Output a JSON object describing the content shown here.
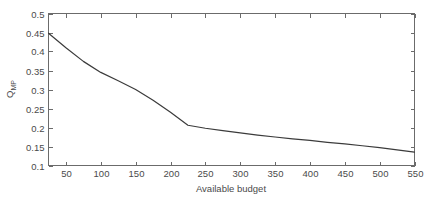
{
  "chart_data": {
    "type": "line",
    "title": "",
    "xlabel": "Available budget",
    "ylabel": "Q_MP",
    "ylabel_base": "Q",
    "ylabel_subscript": "MP",
    "xlim": [
      25,
      550
    ],
    "ylim": [
      0.1,
      0.5
    ],
    "xticks": [
      50,
      100,
      150,
      200,
      250,
      300,
      350,
      400,
      450,
      500,
      550
    ],
    "xticklabels": [
      "50",
      "100",
      "150",
      "200",
      "250",
      "300",
      "350",
      "400",
      "450",
      "500",
      "550"
    ],
    "yticks": [
      0.1,
      0.15,
      0.2,
      0.25,
      0.3,
      0.35,
      0.4,
      0.45,
      0.5
    ],
    "yticklabels": [
      "0.1",
      "0.15",
      "0.2",
      "0.25",
      "0.3",
      "0.35",
      "0.4",
      "0.45",
      "0.5"
    ],
    "grid": false,
    "legend": null,
    "box": true,
    "tick_direction": "in",
    "line_color": "#3b3b3b",
    "axis_color": "#6b6b6b",
    "background_color": "#ffffff",
    "series": [
      {
        "name": "Q_MP",
        "x": [
          25,
          50,
          75,
          100,
          125,
          150,
          175,
          200,
          225,
          250,
          275,
          300,
          325,
          350,
          375,
          400,
          425,
          450,
          475,
          500,
          525,
          550
        ],
        "y": [
          0.448,
          0.41,
          0.374,
          0.345,
          0.323,
          0.3,
          0.272,
          0.24,
          0.206,
          0.198,
          0.192,
          0.186,
          0.18,
          0.175,
          0.17,
          0.166,
          0.161,
          0.157,
          0.152,
          0.147,
          0.141,
          0.135
        ]
      }
    ]
  },
  "figure": {
    "width": 425,
    "height": 199
  }
}
